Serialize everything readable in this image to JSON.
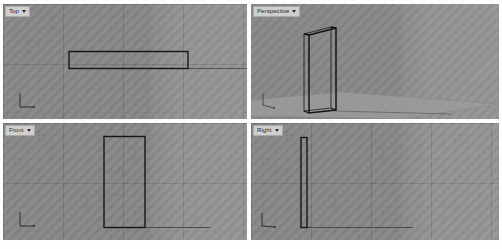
{
  "app": {
    "name": "3D CAD Modeler",
    "layout": "four-viewport"
  },
  "viewports": [
    {
      "id": "top",
      "label": "Top",
      "caret": "chevron-down-icon",
      "projection": "orthographic-plan",
      "description": "Plan view of a thin rectangular door panel"
    },
    {
      "id": "perspective",
      "label": "Perspective",
      "caret": "chevron-down-icon",
      "projection": "perspective",
      "description": "Shaded perspective of a vertical panel standing on a ground plane"
    },
    {
      "id": "front",
      "label": "Front",
      "caret": "chevron-down-icon",
      "projection": "orthographic-elevation",
      "description": "Front elevation of a tall rectangular door panel"
    },
    {
      "id": "right",
      "label": "Right",
      "caret": "chevron-down-icon",
      "projection": "orthographic-side",
      "description": "Right side edge-on view of the thin panel"
    }
  ],
  "colors": {
    "viewport_background": "#8d8d8d",
    "grid_line": "#787878",
    "wireframe": "#161616",
    "ground_plane": "#9c9c9c",
    "divider": "#fdfdfd",
    "title_tab": "#cfcfcf",
    "title_text": "#1c1c1c"
  }
}
